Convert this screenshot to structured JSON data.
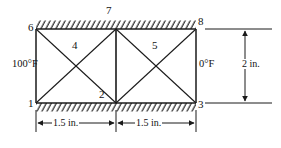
{
  "diagram": {
    "nodes": [
      {
        "id": "6",
        "label": "6",
        "x": 36,
        "y": 29
      },
      {
        "id": "7",
        "label": "7",
        "x": 116,
        "y": 29
      },
      {
        "id": "8",
        "label": "8",
        "x": 196,
        "y": 29
      },
      {
        "id": "1",
        "label": "1",
        "x": 36,
        "y": 103
      },
      {
        "id": "2",
        "label": "2",
        "x": 116,
        "y": 103
      },
      {
        "id": "3",
        "label": "3",
        "x": 196,
        "y": 103
      }
    ],
    "elements": [
      {
        "id": "4",
        "label": "4",
        "panel": "left"
      },
      {
        "id": "5",
        "label": "5",
        "panel": "right"
      }
    ],
    "boundary_conditions": {
      "left_temperature": "100°F",
      "right_temperature": "0°F",
      "top_edge": "hatched-fixed",
      "bottom_edge": "hatched-fixed"
    },
    "dimensions": [
      {
        "name": "left-panel-width",
        "label": "1.5 in.",
        "orientation": "horizontal"
      },
      {
        "name": "right-panel-width",
        "label": "1.5 in.",
        "orientation": "horizontal"
      },
      {
        "name": "height",
        "label": "2 in.",
        "orientation": "vertical"
      }
    ],
    "colors": {
      "line": "#1a1a1a",
      "background": "#ffffff",
      "hatch": "#1a1a1a"
    }
  }
}
